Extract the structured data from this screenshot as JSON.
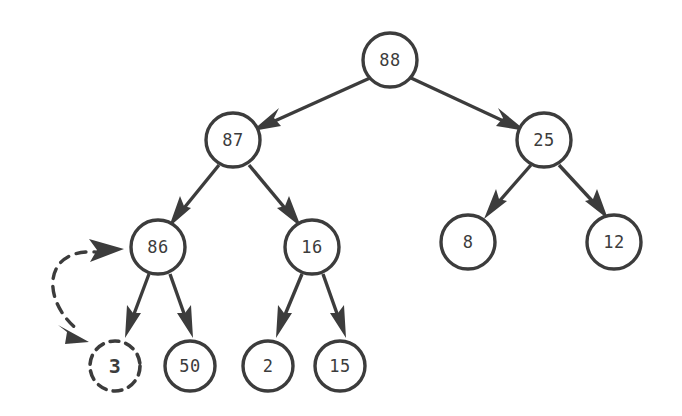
{
  "diagram": {
    "type": "binary-tree",
    "title": "",
    "stroke_color": "#3c3c3c",
    "background_color": "#ffffff",
    "nodes": [
      {
        "id": "n88",
        "label": "88",
        "cx": 390,
        "cy": 60,
        "r": 27,
        "style": "solid",
        "emphasis": false
      },
      {
        "id": "n87",
        "label": "87",
        "cx": 233,
        "cy": 140,
        "r": 27,
        "style": "solid",
        "emphasis": false
      },
      {
        "id": "n25",
        "label": "25",
        "cx": 544,
        "cy": 140,
        "r": 27,
        "style": "solid",
        "emphasis": false
      },
      {
        "id": "n86",
        "label": "86",
        "cx": 158,
        "cy": 247,
        "r": 27,
        "style": "solid",
        "emphasis": false
      },
      {
        "id": "n16",
        "label": "16",
        "cx": 312,
        "cy": 247,
        "r": 27,
        "style": "solid",
        "emphasis": false
      },
      {
        "id": "n8",
        "label": "8",
        "cx": 468,
        "cy": 242,
        "r": 27,
        "style": "solid",
        "emphasis": false
      },
      {
        "id": "n12",
        "label": "12",
        "cx": 614,
        "cy": 242,
        "r": 27,
        "style": "solid",
        "emphasis": false
      },
      {
        "id": "n3",
        "label": "3",
        "cx": 115,
        "cy": 366,
        "r": 25,
        "style": "dashed",
        "emphasis": true
      },
      {
        "id": "n50",
        "label": "50",
        "cx": 190,
        "cy": 366,
        "r": 25,
        "style": "solid",
        "emphasis": false
      },
      {
        "id": "n2",
        "label": "2",
        "cx": 268,
        "cy": 366,
        "r": 25,
        "style": "solid",
        "emphasis": false
      },
      {
        "id": "n15",
        "label": "15",
        "cx": 340,
        "cy": 366,
        "r": 25,
        "style": "solid",
        "emphasis": false
      }
    ],
    "edges": [
      {
        "id": "e-88-87",
        "from": "n88",
        "to": "n87",
        "style": "solid",
        "arrow": "end"
      },
      {
        "id": "e-88-25",
        "from": "n88",
        "to": "n25",
        "style": "solid",
        "arrow": "end"
      },
      {
        "id": "e-87-86",
        "from": "n87",
        "to": "n86",
        "style": "solid",
        "arrow": "end"
      },
      {
        "id": "e-87-16",
        "from": "n87",
        "to": "n16",
        "style": "solid",
        "arrow": "end"
      },
      {
        "id": "e-25-8",
        "from": "n25",
        "to": "n8",
        "style": "solid",
        "arrow": "end"
      },
      {
        "id": "e-25-12",
        "from": "n25",
        "to": "n12",
        "style": "solid",
        "arrow": "end"
      },
      {
        "id": "e-86-3",
        "from": "n86",
        "to": "n3",
        "style": "solid",
        "arrow": "end"
      },
      {
        "id": "e-86-50",
        "from": "n86",
        "to": "n50",
        "style": "solid",
        "arrow": "end"
      },
      {
        "id": "e-16-2",
        "from": "n16",
        "to": "n2",
        "style": "solid",
        "arrow": "end"
      },
      {
        "id": "e-16-15",
        "from": "n16",
        "to": "n15",
        "style": "solid",
        "arrow": "end"
      }
    ],
    "swap_arrow": {
      "id": "swap-86-3",
      "between": [
        "n86",
        "n3"
      ],
      "style": "dashed",
      "arrow": "both",
      "description": "dashed double-headed curved arrow indicating swap"
    }
  }
}
